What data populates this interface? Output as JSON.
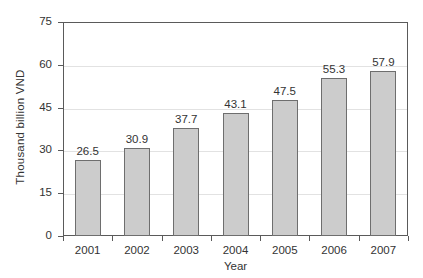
{
  "chart_data": {
    "type": "bar",
    "title": "",
    "xlabel": "Year",
    "ylabel": "Thousand billion VND",
    "categories": [
      "2001",
      "2002",
      "2003",
      "2004",
      "2005",
      "2006",
      "2007"
    ],
    "values": [
      26.5,
      30.9,
      37.7,
      43.1,
      47.5,
      55.3,
      57.9
    ],
    "value_labels": [
      "26.5",
      "30.9",
      "37.7",
      "43.1",
      "47.5",
      "55.3",
      "57.9"
    ],
    "ylim": [
      0,
      75
    ],
    "yticks": [
      0,
      15,
      30,
      45,
      60,
      75
    ],
    "ytick_labels": [
      "0",
      "15",
      "30",
      "45",
      "60",
      "75"
    ],
    "grid": true,
    "legend": "none",
    "bar_fill_color": "#cccccc",
    "bar_border_color": "#6e6e6e",
    "gridline_color": "#e2e2e2",
    "axis_color": "#5a5a5a",
    "text_color": "#333333",
    "background_color": "#ffffff"
  }
}
